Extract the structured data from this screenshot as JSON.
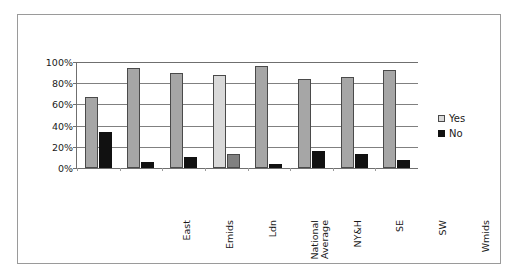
{
  "chart_data": {
    "type": "bar",
    "title": "",
    "xlabel": "",
    "ylabel": "",
    "ylim": [
      0,
      100
    ],
    "ytick_labels": [
      "100%",
      "80%",
      "60%",
      "40%",
      "20%",
      "0%"
    ],
    "ytick_values": [
      100,
      80,
      60,
      40,
      20,
      0
    ],
    "grid": true,
    "legend_position": "right",
    "categories": [
      "East",
      "Emids",
      "Ldn",
      "National\nAverage",
      "NY&H",
      "SE",
      "SW",
      "Wmids"
    ],
    "series": [
      {
        "name": "Yes",
        "color": "#a6a6a6",
        "values": [
          67,
          94,
          90,
          88,
          96,
          84,
          86,
          92
        ]
      },
      {
        "name": "No",
        "color": "#111111",
        "values": [
          34,
          6,
          10,
          13,
          4,
          16,
          13,
          8
        ]
      }
    ],
    "highlight_category": "National\nAverage",
    "highlight_colors": {
      "yes": "#d9d9d9",
      "no": "#808080"
    }
  },
  "legend": {
    "items": [
      {
        "label": "Yes",
        "swatch": "legend-swatch-yes"
      },
      {
        "label": "No",
        "swatch": "legend-swatch-no"
      }
    ]
  }
}
